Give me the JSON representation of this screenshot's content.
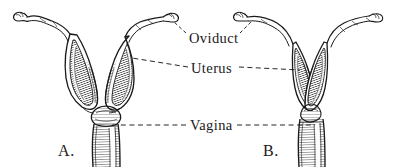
{
  "figure": {
    "kind": "anatomical-line-engraving",
    "background_color": "#ffffff",
    "ink_color": "#1a1a1a",
    "callouts": [
      {
        "id": "oviduct",
        "label": "Oviduct"
      },
      {
        "id": "uterus",
        "label": "Uterus"
      },
      {
        "id": "vagina",
        "label": "Vagina"
      }
    ],
    "specimens": [
      {
        "id": "a",
        "letter": "A.",
        "description": "broad widely-divergent uterine horns"
      },
      {
        "id": "b",
        "letter": "B.",
        "description": "narrow closely-apposed uterine horns"
      }
    ]
  }
}
